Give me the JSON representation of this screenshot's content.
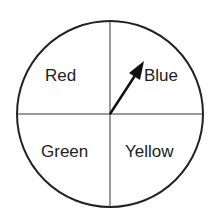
{
  "spinner": {
    "sections": [
      {
        "id": "red",
        "label": "Red"
      },
      {
        "id": "blue",
        "label": "Blue"
      },
      {
        "id": "green",
        "label": "Green"
      },
      {
        "id": "yellow",
        "label": "Yellow"
      }
    ],
    "pointer_points_to": "Blue"
  }
}
